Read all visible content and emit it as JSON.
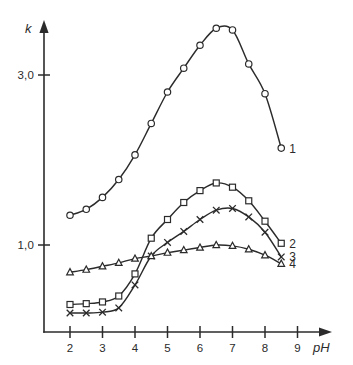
{
  "chart_data": {
    "type": "line",
    "title": "",
    "xlabel": "pH",
    "ylabel": "k",
    "xlim": [
      1.4,
      9.6
    ],
    "ylim": [
      0.0,
      3.9
    ],
    "grid": false,
    "legend_position": "right-end-of-curve",
    "x_ticks": [
      2,
      3,
      4,
      5,
      6,
      7,
      8,
      9
    ],
    "x_tick_labels": [
      "2",
      "3",
      "4",
      "5",
      "6",
      "7",
      "8",
      "9"
    ],
    "y_ticks": [
      1.0,
      3.0
    ],
    "y_tick_labels": [
      "1,0",
      "3,0"
    ],
    "x": [
      2.0,
      2.5,
      3.0,
      3.5,
      4.0,
      4.5,
      5.0,
      5.5,
      6.0,
      6.5,
      7.0,
      7.5,
      8.0,
      8.5
    ],
    "series": [
      {
        "name": "1",
        "label": "1",
        "marker": "circle",
        "values": [
          1.35,
          1.42,
          1.56,
          1.77,
          2.06,
          2.43,
          2.8,
          3.08,
          3.35,
          3.55,
          3.53,
          3.13,
          2.78,
          2.14
        ]
      },
      {
        "name": "2",
        "label": "2",
        "marker": "square",
        "values": [
          0.3,
          0.31,
          0.33,
          0.4,
          0.66,
          1.08,
          1.3,
          1.5,
          1.64,
          1.73,
          1.68,
          1.52,
          1.28,
          1.02
        ]
      },
      {
        "name": "3",
        "label": "3",
        "marker": "cross",
        "values": [
          0.2,
          0.2,
          0.21,
          0.26,
          0.53,
          0.87,
          1.03,
          1.16,
          1.3,
          1.41,
          1.43,
          1.33,
          1.15,
          0.86
        ]
      },
      {
        "name": "4",
        "label": "4",
        "marker": "triangle",
        "values": [
          0.68,
          0.71,
          0.75,
          0.79,
          0.84,
          0.87,
          0.91,
          0.94,
          0.97,
          1.0,
          0.99,
          0.95,
          0.88,
          0.78
        ]
      }
    ]
  },
  "axes": {
    "y_axis_label": "k",
    "x_axis_label": "pH"
  },
  "icons": {
    "y_arrow": "arrow-up-icon",
    "x_arrow": "arrow-right-icon"
  }
}
